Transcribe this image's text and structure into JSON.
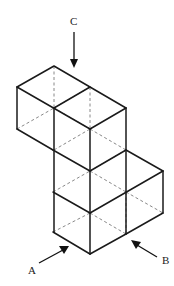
{
  "diagram": {
    "type": "isometric-cube-arrangement",
    "views": [
      {
        "id": "A",
        "label": "A",
        "direction": "from lower-left (front-left face)"
      },
      {
        "id": "B",
        "label": "B",
        "direction": "from lower-right (front-right face)"
      },
      {
        "id": "C",
        "label": "C",
        "direction": "from above (top view)"
      }
    ],
    "colors": {
      "solid_edge": "#1a1a1a",
      "hidden_edge": "#7a7a7a",
      "background": "#ffffff"
    },
    "legend": {
      "solid": "visible edges",
      "dashed": "hidden edges"
    }
  }
}
